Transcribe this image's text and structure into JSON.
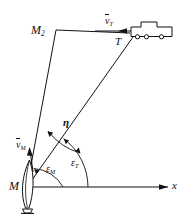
{
  "figure": {
    "background_color": "#ffffff",
    "stroke_color": "#111111",
    "width": 186,
    "height": 216
  },
  "labels": {
    "missile_point": "M",
    "missile_position_2": "M",
    "missile_position_2_sub": "2",
    "target_point": "T",
    "axis_x": "x",
    "target_velocity": "v",
    "target_velocity_sub": "T",
    "missile_velocity": "v",
    "missile_velocity_sub": "M",
    "angle_eta": "η",
    "angle_eps_missile": "ε",
    "angle_eps_missile_sub": "M",
    "angle_eps_target": "ε",
    "angle_eps_target_sub": "T"
  },
  "geometry": {
    "origin_M": [
      27,
      187
    ],
    "point_M2": [
      56,
      30
    ],
    "point_T": [
      133,
      36
    ],
    "axis_x_end": [
      170,
      187
    ],
    "axis_x_arrow_tip": [
      170,
      187
    ],
    "line_M_to_M2": "launcher to missile position",
    "line_M_to_T": "line of sight to target",
    "line_M2_to_T": "missile heading to target"
  },
  "icons": {
    "target_vehicle": "truck-icon",
    "launcher": "missile-launcher-icon",
    "x_axis_arrow": "arrow-right-icon",
    "target_velocity_arrow": "arrow-left-icon",
    "missile_velocity_arrow": "arrow-up-icon"
  },
  "angles": {
    "eps_missile_arc": "arc from x-axis to M-M2 line",
    "eps_target_arc": "arc from x-axis to M-T line",
    "eta_arc": "arc between M-M2 line and M-T line"
  }
}
